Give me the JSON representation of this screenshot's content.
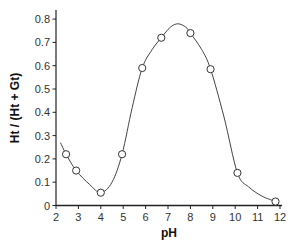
{
  "chart_data": {
    "type": "line",
    "title": "",
    "xlabel": "pH",
    "ylabel": "Ht / (Ht + Gt)",
    "xlim": [
      2,
      12
    ],
    "ylim": [
      0,
      0.8
    ],
    "x_ticks": [
      2,
      3,
      4,
      5,
      6,
      7,
      8,
      9,
      10,
      11,
      12
    ],
    "y_ticks": [
      0,
      0.1,
      0.2,
      0.3,
      0.4,
      0.5,
      0.6,
      0.7,
      0.8
    ],
    "y_tick_labels": [
      "0",
      "0.1",
      "0.2",
      "0.3",
      "0.4",
      "0.5",
      "0.6",
      "0.7",
      "0.8"
    ],
    "grid": false,
    "legend": null,
    "series": [
      {
        "name": "measured",
        "marker": "open-circle",
        "x": [
          2.45,
          2.9,
          4.0,
          4.95,
          5.85,
          6.7,
          8.0,
          8.9,
          10.1,
          11.8
        ],
        "y": [
          0.22,
          0.15,
          0.055,
          0.22,
          0.59,
          0.72,
          0.74,
          0.585,
          0.14,
          0.017
        ]
      },
      {
        "name": "fitted curve",
        "marker": "none",
        "x": [
          2.2,
          2.45,
          2.9,
          3.5,
          4.0,
          4.5,
          4.95,
          5.4,
          5.85,
          6.3,
          6.7,
          7.1,
          7.45,
          7.8,
          8.0,
          8.5,
          8.9,
          9.5,
          10.1,
          10.6,
          11.2,
          11.8
        ],
        "y": [
          0.27,
          0.22,
          0.15,
          0.09,
          0.055,
          0.1,
          0.22,
          0.42,
          0.59,
          0.67,
          0.72,
          0.765,
          0.78,
          0.765,
          0.74,
          0.67,
          0.585,
          0.38,
          0.14,
          0.08,
          0.04,
          0.017
        ]
      }
    ]
  },
  "axes": {
    "x_title": "pH",
    "y_title": "Ht / (Ht + Gt)"
  }
}
